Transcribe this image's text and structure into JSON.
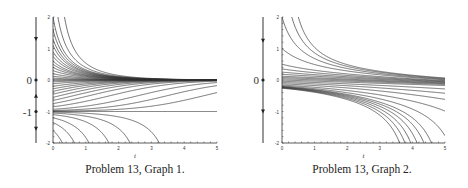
{
  "figures": [
    {
      "id": "graph1",
      "caption": "Problem 13, Graph 1.",
      "xlabel": "t",
      "x_ticks": [
        "0",
        "1",
        "2",
        "3",
        "4",
        "5"
      ],
      "y_ticks": [
        "2",
        "1",
        "0",
        "-1",
        "-2"
      ],
      "phase_line_labels": [
        "0",
        "-1"
      ],
      "equation_behavior": "dy/dt = -y(1+y)"
    },
    {
      "id": "graph2",
      "caption": "Problem 13, Graph 2.",
      "xlabel": "t",
      "x_ticks": [
        "0",
        "1",
        "2",
        "3",
        "4",
        "5"
      ],
      "y_ticks": [
        "2",
        "1",
        "0",
        "-1",
        "-2"
      ],
      "phase_line_labels": [
        "0"
      ],
      "equation_behavior": "dy/dt = -y^2"
    }
  ],
  "chart_data": [
    {
      "type": "line",
      "title": "Problem 13, Graph 1.",
      "xlabel": "t",
      "ylabel": "",
      "xlim": [
        0,
        5
      ],
      "ylim": [
        -2,
        2
      ],
      "x_ticks": [
        0,
        1,
        2,
        3,
        4,
        5
      ],
      "y_ticks": [
        -2,
        -1,
        0,
        1,
        2
      ],
      "equilibria": [
        0,
        -1
      ],
      "phase_line": {
        "equilibria": [
          0,
          -1
        ],
        "arrows": [
          "down above 0",
          "up between -1 and 0",
          "down below -1"
        ]
      },
      "series_description": "Solution curves: those above -1 approach 0; y=-1 constant; those below -1 fall off below -2 at t ≈ 1.1, 1.35, 1.7, 2.4, 3.0, 3.7"
    },
    {
      "type": "line",
      "title": "Problem 13, Graph 2.",
      "xlabel": "t",
      "ylabel": "",
      "xlim": [
        0,
        5
      ],
      "ylim": [
        -2,
        2
      ],
      "x_ticks": [
        0,
        1,
        2,
        3,
        4,
        5
      ],
      "y_ticks": [
        -2,
        -1,
        0,
        1,
        2
      ],
      "equilibria": [
        0
      ],
      "phase_line": {
        "equilibria": [
          0
        ],
        "arrows": [
          "down above 0",
          "down below 0"
        ]
      },
      "series_description": "Solution curves: positive initial values decay slowly toward 0; negative initial values decrease, some reaching -2 near t ≈ 4.5–5"
    }
  ]
}
